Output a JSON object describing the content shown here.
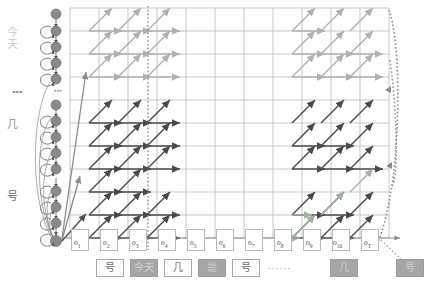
{
  "diagram": {
    "colors": {
      "grid": "#b7b7b7",
      "node": "#8a8a8a",
      "node_edge": "#6b6b6b",
      "path_dark": "#4a4a4a",
      "path_gray": "#b0b0b0",
      "path_green": "#9fb39f",
      "dotted": "#8c8c8c",
      "box_white": "#ffffff",
      "box_gray": "#a6a6a6",
      "text_dim": "#c9c9c9"
    }
  },
  "state_axis": {
    "labels": [
      {
        "text": "今天",
        "tone": "dim"
      },
      {
        "text": "⋮",
        "tone": "dots"
      },
      {
        "text": "几",
        "tone": "mid"
      },
      {
        "text": "号",
        "tone": "dark"
      }
    ],
    "dots_between_states": "⋮"
  },
  "observations": {
    "labels": [
      "o",
      "o",
      "o",
      "o",
      "o",
      "o",
      "o",
      "o",
      "o",
      "o",
      "o"
    ],
    "subs": [
      "1",
      "2",
      "3",
      "4",
      "5",
      "6",
      "7",
      "8",
      "9",
      "10",
      "T"
    ],
    "axis_arrow": true
  },
  "output_sequence": {
    "items": [
      {
        "text": "号",
        "style": "white"
      },
      {
        "text": "今天",
        "style": "gray"
      },
      {
        "text": "几",
        "style": "white"
      },
      {
        "text": "是",
        "style": "gray"
      },
      {
        "text": "号",
        "style": "white"
      },
      {
        "text": "······",
        "style": "dots"
      },
      {
        "text": "几",
        "style": "gray"
      },
      {
        "text": "号",
        "style": "gray"
      }
    ]
  }
}
